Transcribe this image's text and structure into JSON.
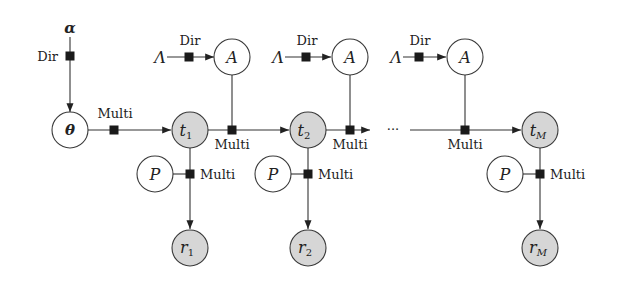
{
  "diagram": {
    "type": "factor-graph",
    "labels": {
      "dir": "Dir",
      "multi": "Multi",
      "ellipsis": "···"
    },
    "hyperparams": {
      "alpha": "α",
      "lambda": "Λ"
    },
    "nodes": {
      "theta": "θ",
      "A": "A",
      "P": "P",
      "t_base": "t",
      "r_base": "r",
      "sub1": "1",
      "sub2": "2",
      "subM": "M"
    },
    "colors": {
      "observed_fill": "#d6d6d6",
      "latent_fill": "#ffffff",
      "factor": "#1a1a1a",
      "edge": "#333333"
    }
  }
}
